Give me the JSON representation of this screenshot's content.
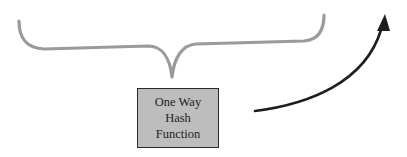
{
  "diagram": {
    "box": {
      "lines": [
        "One Way",
        "Hash",
        "Function"
      ],
      "fill_color": "#bdbdbd",
      "border_color": "#2a2a2a"
    },
    "brace": {
      "color": "#9a9a9a",
      "orientation": "opening-down"
    },
    "arrow": {
      "color": "#1e1e1e",
      "direction": "up-right"
    }
  }
}
